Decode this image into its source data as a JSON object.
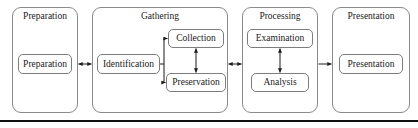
{
  "diagram": {
    "line_color": "#8a8a8a",
    "text_color": "#1a1a1a",
    "rule_color": "#111111",
    "groups": [
      {
        "id": "preparation",
        "label": "Preparation"
      },
      {
        "id": "gathering",
        "label": "Gathering"
      },
      {
        "id": "processing",
        "label": "Processing"
      },
      {
        "id": "presentation",
        "label": "Presentation"
      }
    ],
    "nodes": [
      {
        "id": "preparation-node",
        "label": "Preparation"
      },
      {
        "id": "identification",
        "label": "Identification"
      },
      {
        "id": "collection",
        "label": "Collection"
      },
      {
        "id": "preservation",
        "label": "Preservation"
      },
      {
        "id": "examination",
        "label": "Examination"
      },
      {
        "id": "analysis",
        "label": "Analysis"
      },
      {
        "id": "presentation-node",
        "label": "Presentation"
      }
    ],
    "connectors": [
      {
        "id": "preparation-to-gathering",
        "kind": "double-arrow",
        "orientation": "horizontal"
      },
      {
        "id": "identification-branch",
        "kind": "bracket",
        "orientation": "horizontal"
      },
      {
        "id": "collection-to-preservation",
        "kind": "double-arrow",
        "orientation": "vertical"
      },
      {
        "id": "gathering-to-processing",
        "kind": "double-arrow",
        "orientation": "horizontal"
      },
      {
        "id": "examination-to-analysis",
        "kind": "double-arrow",
        "orientation": "vertical"
      },
      {
        "id": "processing-to-presentation",
        "kind": "single-arrow",
        "orientation": "horizontal"
      }
    ]
  }
}
